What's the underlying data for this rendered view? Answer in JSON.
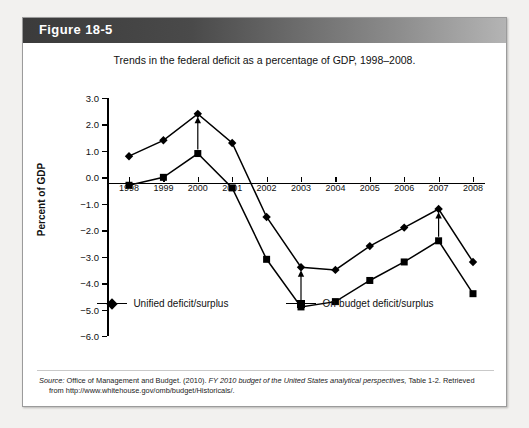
{
  "figure": {
    "header_label": "Figure 18-5",
    "title": "Trends in the federal deficit as a percentage of GDP, 1998–2008."
  },
  "source": {
    "prefix": "Source:",
    "text_before_italic": " Office of Management and Budget. (2010).",
    "italic": " FY 2010 budget of the United States analytical perspectives,",
    "text_after_italic": " Table 1-2. Retrieved",
    "line2": "from http://www.whitehouse.gov/omb/budget/Historicals/."
  },
  "legend": {
    "entries": [
      {
        "label": "Unified deficit/surplus",
        "marker": "diamond-marker"
      },
      {
        "label": "On-budget deficit/surplus",
        "marker": "square-marker"
      }
    ]
  },
  "colors": {
    "series": "#000000",
    "axis": "#000000",
    "header_dark": "#3b3b3b",
    "header_light": "#b4b4b4",
    "card_border": "#9b9b9b",
    "page_background": "#f2f1ef"
  },
  "chart_data": {
    "type": "line",
    "title": "Trends in the federal deficit as a percentage of GDP, 1998–2008.",
    "xlabel": "",
    "ylabel": "Percent of GDP",
    "categories": [
      "1998",
      "1999",
      "2000",
      "2001",
      "2002",
      "2003",
      "2004",
      "2005",
      "2006",
      "2007",
      "2008"
    ],
    "ylim": [
      -6.0,
      3.0
    ],
    "yticks": [
      3.0,
      2.0,
      1.0,
      0.0,
      -1.0,
      -2.0,
      -3.0,
      -4.0,
      -5.0,
      -6.0
    ],
    "ytick_labels": [
      "3.0",
      "2.0",
      "1.0",
      "0.0",
      "−1.0",
      "−2.0",
      "−3.0",
      "−4.0",
      "−5.0",
      "−6.0"
    ],
    "grid": false,
    "legend_position": "bottom",
    "series": [
      {
        "name": "Unified deficit/surplus",
        "marker": "diamond",
        "values": [
          0.8,
          1.4,
          2.4,
          1.3,
          -1.5,
          -3.4,
          -3.5,
          -2.6,
          -1.9,
          -1.2,
          -3.2
        ]
      },
      {
        "name": "On-budget deficit/surplus",
        "marker": "square",
        "values": [
          -0.3,
          0.0,
          0.9,
          -0.4,
          -3.1,
          -4.9,
          -4.7,
          -3.9,
          -3.2,
          -2.4,
          -4.4
        ]
      }
    ],
    "annotations": [
      {
        "type": "gap-arrow",
        "x": "2000",
        "from": 0.9,
        "to": 2.4
      },
      {
        "type": "gap-arrow",
        "x": "2003",
        "from": -4.9,
        "to": -3.4
      },
      {
        "type": "gap-arrow",
        "x": "2007",
        "from": -2.4,
        "to": -1.2
      }
    ]
  }
}
